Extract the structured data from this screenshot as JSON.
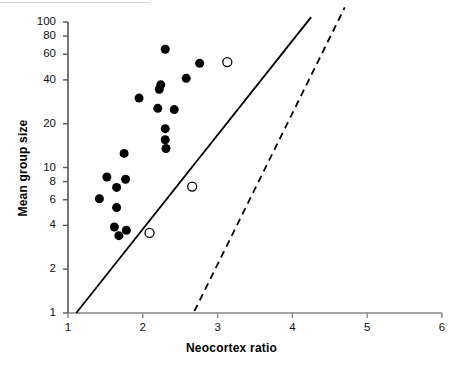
{
  "figure": {
    "type": "scatter-plot",
    "background_color": "#ffffff",
    "foreground_color": "#000000"
  },
  "chart_data": {
    "type": "scatter",
    "title": "",
    "subtitle": "",
    "xlabel": "Neocortex ratio",
    "ylabel": "Mean group size",
    "xscale": "linear",
    "yscale": "log",
    "xlim": [
      1,
      6
    ],
    "ylim": [
      1,
      100
    ],
    "grid": false,
    "legend_position": "none",
    "xticks": [
      1,
      2,
      3,
      4,
      5,
      6
    ],
    "xtick_labels": [
      "1",
      "2",
      "3",
      "4",
      "5",
      "6"
    ],
    "yticks": [
      1,
      2,
      4,
      6,
      8,
      10,
      20,
      40,
      60,
      80,
      100
    ],
    "ytick_labels": [
      "1",
      "2",
      "4",
      "6",
      "8",
      "10",
      "20",
      "40",
      "60",
      "80",
      "100"
    ],
    "series": [
      {
        "name": "filled-circles",
        "marker": "filled-circle",
        "marker_color": "#000000",
        "marker_size": 9,
        "points": [
          {
            "x": 1.42,
            "y": 6.1
          },
          {
            "x": 1.52,
            "y": 8.6
          },
          {
            "x": 1.65,
            "y": 7.3
          },
          {
            "x": 1.65,
            "y": 5.3
          },
          {
            "x": 1.62,
            "y": 3.9
          },
          {
            "x": 1.68,
            "y": 3.4
          },
          {
            "x": 1.78,
            "y": 3.7
          },
          {
            "x": 1.77,
            "y": 8.3
          },
          {
            "x": 1.75,
            "y": 12.5
          },
          {
            "x": 1.95,
            "y": 30.0
          },
          {
            "x": 2.2,
            "y": 25.5
          },
          {
            "x": 2.22,
            "y": 34.5
          },
          {
            "x": 2.24,
            "y": 37.0
          },
          {
            "x": 2.3,
            "y": 65.0
          },
          {
            "x": 2.3,
            "y": 18.5
          },
          {
            "x": 2.3,
            "y": 15.5
          },
          {
            "x": 2.31,
            "y": 13.5
          },
          {
            "x": 2.42,
            "y": 25.0
          },
          {
            "x": 2.58,
            "y": 41.0
          },
          {
            "x": 2.76,
            "y": 52.0
          }
        ]
      },
      {
        "name": "open-circles",
        "marker": "open-circle",
        "marker_color": "#000000",
        "marker_size": 9,
        "points": [
          {
            "x": 2.09,
            "y": 3.55
          },
          {
            "x": 2.66,
            "y": 7.4
          },
          {
            "x": 3.13,
            "y": 53.0
          }
        ]
      }
    ],
    "lines": [
      {
        "name": "solid-regression-line",
        "style": "solid",
        "color": "#000000",
        "width": 1.8,
        "start": {
          "x": 1.11,
          "y": 1.0
        },
        "end": {
          "x": 4.25,
          "y": 108.0
        }
      },
      {
        "name": "dashed-regression-line",
        "style": "dashed",
        "color": "#000000",
        "width": 1.8,
        "start": {
          "x": 2.69,
          "y": 1.03
        },
        "end": {
          "x": 4.7,
          "y": 126.0
        }
      }
    ]
  },
  "axes": {
    "x_title": "Neocortex ratio",
    "y_title": "Mean group size"
  }
}
